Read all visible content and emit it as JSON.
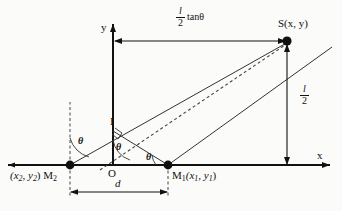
{
  "figure": {
    "axes": {
      "x_label": "x",
      "y_label": "y",
      "origin_label": "O"
    },
    "points": [
      {
        "id": "S",
        "label": "S(x, y)",
        "x": 287,
        "y": 41
      },
      {
        "id": "M1",
        "label": "M",
        "sub": "1",
        "coords": "(x1, y1)",
        "x": 168,
        "y": 165
      },
      {
        "id": "M2",
        "label": "M",
        "sub": "2",
        "coords": "(x2, y2)",
        "x": 70,
        "y": 165
      },
      {
        "id": "I",
        "label": "I",
        "x": 113,
        "y": 125
      }
    ],
    "point_labels": {
      "S": "S(x, y)",
      "M1_name": "M",
      "M1_sub": "1",
      "M1_coords": "(x",
      "M1_coords_sub1": "1",
      "M1_coords_mid": ", y",
      "M1_coords_sub2": "1",
      "M1_coords_end": ")",
      "M2_name": "M",
      "M2_sub": "2",
      "M2_coords_open": "(x",
      "M2_coords_sub1": "2",
      "M2_coords_mid": ", y",
      "M2_coords_sub2": "2",
      "M2_coords_end": ")",
      "I": "I",
      "O": "O"
    },
    "angles": [
      {
        "id": "theta-at-M2",
        "label": "θ",
        "x": 82,
        "y": 142
      },
      {
        "id": "theta-at-O",
        "label": "θ",
        "x": 113,
        "y": 148
      },
      {
        "id": "theta-at-M1",
        "label": "θ",
        "x": 148,
        "y": 160
      }
    ],
    "dimensions": [
      {
        "id": "half-l-tan-theta",
        "numerator": "l",
        "denominator": "2",
        "tail": "tanθ",
        "text": "l/2 tanθ",
        "orientation": "horizontal"
      },
      {
        "id": "half-l",
        "numerator": "l",
        "denominator": "2",
        "text": "l/2",
        "orientation": "vertical"
      },
      {
        "id": "d-spacing",
        "text": "d",
        "orientation": "horizontal"
      }
    ],
    "colors": {
      "stroke": "#111111",
      "background": "#fbfbf9",
      "dot": "#101010",
      "dashed": "#444444"
    }
  }
}
